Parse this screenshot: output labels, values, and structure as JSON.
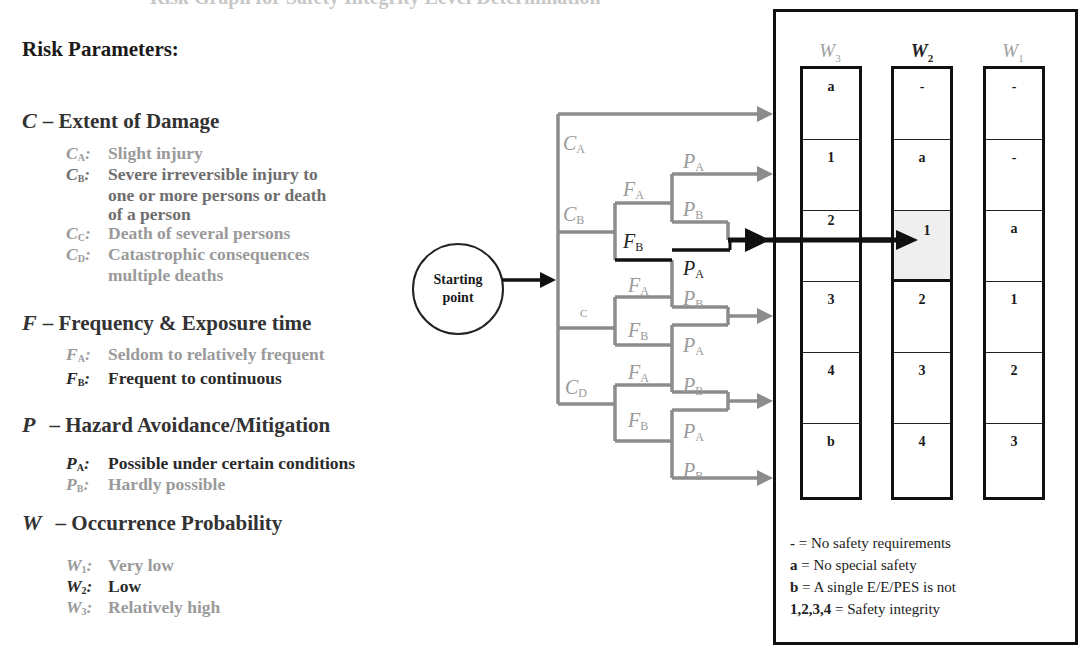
{
  "page": {
    "title_cut": "Risk Graph for Safety Integrity Level Determination"
  },
  "left": {
    "heading": "Risk Parameters:",
    "sections": [
      {
        "var": "C",
        "title": "– Extent of Damage",
        "items": [
          {
            "label": "C",
            "sub": "A",
            "text": "Slight injury",
            "tone": "grey"
          },
          {
            "label": "C",
            "sub": "B",
            "text": "Severe irreversible injury to",
            "tone": "mid"
          },
          {
            "label": "",
            "sub": "",
            "text": "one or more persons or death",
            "tone": "mid"
          },
          {
            "label": "",
            "sub": "",
            "text": "of a person",
            "tone": "mid"
          },
          {
            "label": "C",
            "sub": "C",
            "text": "Death of several persons",
            "tone": "grey"
          },
          {
            "label": "C",
            "sub": "D",
            "text": "Catastrophic consequences",
            "tone": "grey"
          },
          {
            "label": "",
            "sub": "",
            "text": "multiple deaths",
            "tone": "grey"
          }
        ]
      },
      {
        "var": "F",
        "title": "– Frequency & Exposure time",
        "items": [
          {
            "label": "F",
            "sub": "A",
            "text": "Seldom to relatively frequent",
            "tone": "grey"
          },
          {
            "label": "F",
            "sub": "B",
            "text": "Frequent to continuous",
            "tone": "dark"
          }
        ]
      },
      {
        "var": "P",
        "title": "– Hazard Avoidance/Mitigation",
        "items": [
          {
            "label": "P",
            "sub": "A",
            "text": "Possible under certain conditions",
            "tone": "dark"
          },
          {
            "label": "P",
            "sub": "B",
            "text": "Hardly possible",
            "tone": "grey"
          }
        ]
      },
      {
        "var": "W",
        "title": "– Occurrence Probability",
        "items": [
          {
            "label": "W",
            "sub": "1",
            "text": "Very low",
            "tone": "grey"
          },
          {
            "label": "W",
            "sub": "2",
            "text": "Low",
            "tone": "dark"
          },
          {
            "label": "W",
            "sub": "3",
            "text": "Relatively high",
            "tone": "grey"
          }
        ]
      }
    ]
  },
  "tree": {
    "start_line1": "Starting",
    "start_line2": "point",
    "labels": {
      "CA": "C",
      "CA_sub": "A",
      "CB": "C",
      "CB_sub": "B",
      "CC": "C",
      "CD": "C",
      "CD_sub": "D",
      "F": "F",
      "P": "P",
      "A": "A",
      "B": "B"
    },
    "colors": {
      "active": "#111111",
      "inactive": "#8c8c8c"
    }
  },
  "table": {
    "columns": [
      {
        "label": "W",
        "sub": "3",
        "tone": "grey",
        "cells": [
          "a",
          "1",
          "2",
          "3",
          "4",
          "b"
        ]
      },
      {
        "label": "W",
        "sub": "2",
        "tone": "dark",
        "cells": [
          "-",
          "a",
          "1",
          "2",
          "3",
          "4"
        ],
        "highlight_row": 2
      },
      {
        "label": "W",
        "sub": "1",
        "tone": "grey",
        "cells": [
          "-",
          "-",
          "a",
          "1",
          "2",
          "3"
        ]
      }
    ],
    "legend": [
      {
        "key": "-",
        "text": " = No safety requirements"
      },
      {
        "key": "a",
        "text": " = No special safety"
      },
      {
        "key": "b",
        "text": " = A single E/E/PES is not"
      },
      {
        "key": "1,2,3,4",
        "text": " = Safety integrity"
      }
    ]
  }
}
